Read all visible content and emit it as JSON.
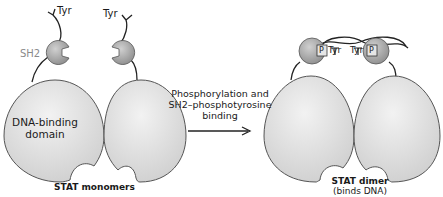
{
  "diagram": {
    "colors": {
      "domain_fill": "#d9d9d9",
      "domain_stroke": "#555555",
      "sh2_fill": "#a6a6a6",
      "line": "#222222",
      "sh2_label": "#8a8a8a",
      "background": "#ffffff"
    },
    "left_panel": {
      "tyr_label_1": "Tyr",
      "tyr_label_2": "Tyr",
      "sh2_label": "SH2",
      "domain_label_line1": "DNA-binding",
      "domain_label_line2": "domain",
      "caption": "STAT monomers"
    },
    "arrow": {
      "label_line1": "Phosphorylation and",
      "label_line2": "SH2–phosphotyrosine",
      "label_line3": "binding",
      "icon": "right-arrow"
    },
    "right_panel": {
      "p_label_left": "P",
      "tyr_label_left": "Tyr",
      "tyr_label_right": "Tyr",
      "p_label_right": "P",
      "caption_line1": "STAT dimer",
      "caption_line2": "(binds DNA)"
    }
  }
}
